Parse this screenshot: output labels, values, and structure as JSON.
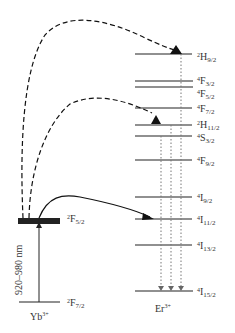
{
  "diagram": {
    "type": "energy-level-diagram",
    "yb": {
      "ion_label": "Yb",
      "ion_charge": "3+",
      "levels": [
        {
          "sup": "2",
          "term": "F",
          "sub": "5/2",
          "y": 221
        },
        {
          "sup": "2",
          "term": "F",
          "sub": "7/2",
          "y": 302
        }
      ],
      "excitation_label": "920–980 nm"
    },
    "er": {
      "ion_label": "Er",
      "ion_charge": "3+",
      "levels": [
        {
          "sup": "2",
          "term": "H",
          "sub": "9/2",
          "y": 54
        },
        {
          "sup": "4",
          "term": "F",
          "sub": "3/2",
          "y": 81
        },
        {
          "sup": "4",
          "term": "F",
          "sub": "5/2",
          "y": 87
        },
        {
          "sup": "4",
          "term": "F",
          "sub": "7/2",
          "y": 108
        },
        {
          "sup": "2",
          "term": "H",
          "sub": "11/2",
          "y": 125
        },
        {
          "sup": "4",
          "term": "S",
          "sub": "3/2",
          "y": 136
        },
        {
          "sup": "4",
          "term": "F",
          "sub": "9/2",
          "y": 160
        },
        {
          "sup": "4",
          "term": "I",
          "sub": "9/2",
          "y": 197
        },
        {
          "sup": "4",
          "term": "I",
          "sub": "11/2",
          "y": 219
        },
        {
          "sup": "4",
          "term": "I",
          "sub": "13/2",
          "y": 245
        },
        {
          "sup": "4",
          "term": "I",
          "sub": "15/2",
          "y": 291
        }
      ]
    },
    "transfers": [
      {
        "type": "solid",
        "from": "Yb 2F5/2",
        "to": "Er 4I11/2"
      },
      {
        "type": "dashed",
        "from": "Yb 2F5/2",
        "to": "Er 4F7/2"
      },
      {
        "type": "dashed",
        "from": "Yb 2F5/2",
        "to": "Er 2H9/2"
      }
    ],
    "emissions": [
      {
        "type": "dotted",
        "from": "Er 4F9/2",
        "to": "Er 4I15/2"
      },
      {
        "type": "dotted",
        "from": "Er 4S3/2",
        "to": "Er 4I15/2"
      },
      {
        "type": "dotted",
        "from": "Er 2H9/2",
        "to": "Er 4I15/2"
      }
    ]
  },
  "labels": {
    "yb_upper": {
      "sup": "2",
      "term": "F",
      "sub": "5/2"
    },
    "yb_lower": {
      "sup": "2",
      "term": "F",
      "sub": "7/2"
    },
    "yb_ion": {
      "name": "Yb",
      "charge": "3+"
    },
    "er_ion": {
      "name": "Er",
      "charge": "3+"
    },
    "excitation": "920–980 nm",
    "er_levels": [
      {
        "sup": "2",
        "term": "H",
        "sub": "9/2"
      },
      {
        "sup": "4",
        "term": "F",
        "sub": "3/2"
      },
      {
        "sup": "4",
        "term": "F",
        "sub": "5/2"
      },
      {
        "sup": "4",
        "term": "F",
        "sub": "7/2"
      },
      {
        "sup": "2",
        "term": "H",
        "sub": "11/2"
      },
      {
        "sup": "4",
        "term": "S",
        "sub": "3/2"
      },
      {
        "sup": "4",
        "term": "F",
        "sub": "9/2"
      },
      {
        "sup": "4",
        "term": "I",
        "sub": "9/2"
      },
      {
        "sup": "4",
        "term": "I",
        "sub": "11/2"
      },
      {
        "sup": "4",
        "term": "I",
        "sub": "13/2"
      },
      {
        "sup": "4",
        "term": "I",
        "sub": "15/2"
      }
    ]
  }
}
